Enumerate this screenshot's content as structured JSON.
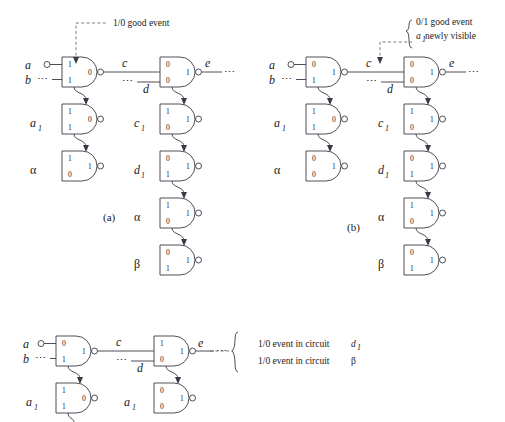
{
  "figure": {
    "panels": [
      {
        "id": "a",
        "caption": "(a)",
        "annotation": {
          "line1": "1/0 good event"
        },
        "inputs": [
          {
            "label": "a",
            "marker": "open-circle"
          },
          {
            "label": "b",
            "marker": "ellipsis"
          }
        ],
        "nets": [
          {
            "label": "c"
          },
          {
            "label": "d"
          },
          {
            "label": "e"
          }
        ],
        "gates": [
          {
            "name": "g-top-left",
            "row_label": "",
            "in_top": "1",
            "in_bottom": "1",
            "out": "0"
          },
          {
            "name": "g-top-right",
            "row_label": "",
            "in_top": "0",
            "in_bottom": "0",
            "out": "1"
          },
          {
            "name": "g-a1",
            "row_label": "a",
            "row_sub": "1",
            "in_top": "1",
            "in_bottom": "1",
            "out": "0"
          },
          {
            "name": "g-alpha-left",
            "row_label": "α",
            "in_top": "1",
            "in_bottom": "0",
            "out": "1"
          },
          {
            "name": "g-c1",
            "row_label": "c",
            "row_sub": "1",
            "in_top": "1",
            "in_bottom": "0",
            "out": "1"
          },
          {
            "name": "g-d1",
            "row_label": "d",
            "row_sub": "1",
            "in_top": "0",
            "in_bottom": "1",
            "out": "1"
          },
          {
            "name": "g-alpha-right",
            "row_label": "α",
            "in_top": "1",
            "in_bottom": "0",
            "out": "1"
          },
          {
            "name": "g-beta-right",
            "row_label": "β",
            "in_top": "0",
            "in_bottom": "1",
            "out": "1"
          }
        ]
      },
      {
        "id": "b",
        "caption": "(b)",
        "annotation": {
          "line1": "0/1 good event",
          "line2_var": "a",
          "line2_sub": "1",
          "line2_rest": " newly visible"
        },
        "inputs": [
          {
            "label": "a",
            "marker": "open-circle"
          },
          {
            "label": "b",
            "marker": "ellipsis"
          }
        ],
        "nets": [
          {
            "label": "c"
          },
          {
            "label": "d"
          },
          {
            "label": "e"
          }
        ],
        "gates": [
          {
            "name": "g-top-left",
            "row_label": "",
            "in_top": "0",
            "in_bottom": "1",
            "out": "1"
          },
          {
            "name": "g-top-right",
            "row_label": "",
            "in_top": "0",
            "in_bottom": "0",
            "out": "1"
          },
          {
            "name": "g-a1",
            "row_label": "a",
            "row_sub": "1",
            "in_top": "1",
            "in_bottom": "1",
            "out": "0"
          },
          {
            "name": "g-alpha-left",
            "row_label": "α",
            "in_top": "0",
            "in_bottom": "0",
            "out": "1"
          },
          {
            "name": "g-c1",
            "row_label": "c",
            "row_sub": "1",
            "in_top": "1",
            "in_bottom": "0",
            "out": "1"
          },
          {
            "name": "g-d1",
            "row_label": "d",
            "row_sub": "1",
            "in_top": "0",
            "in_bottom": "1",
            "out": "1"
          },
          {
            "name": "g-alpha-right",
            "row_label": "α",
            "in_top": "1",
            "in_bottom": "0",
            "out": "1"
          },
          {
            "name": "g-beta-right",
            "row_label": "β",
            "in_top": "0",
            "in_bottom": "1",
            "out": "1"
          }
        ]
      },
      {
        "id": "c",
        "caption": "",
        "annotation": {
          "line1_pre": "1/0 event in circuit ",
          "line1_var": "d",
          "line1_sub": "1",
          "line2_pre": "1/0 event in circuit ",
          "line2_var": "β"
        },
        "inputs": [
          {
            "label": "a",
            "marker": "open-circle"
          },
          {
            "label": "b",
            "marker": "ellipsis"
          }
        ],
        "nets": [
          {
            "label": "c"
          },
          {
            "label": "d"
          },
          {
            "label": "e"
          }
        ],
        "gates": [
          {
            "name": "g-top-left",
            "row_label": "",
            "in_top": "0",
            "in_bottom": "1",
            "out": "1"
          },
          {
            "name": "g-top-right",
            "row_label": "",
            "in_top": "1",
            "in_bottom": "0",
            "out": "1"
          },
          {
            "name": "g-a1-left",
            "row_label": "a",
            "row_sub": "1",
            "in_top": "1",
            "in_bottom": "1",
            "out": "0"
          },
          {
            "name": "g-a1-right",
            "row_label": "a",
            "row_sub": "1",
            "in_top": "0",
            "in_bottom": "0",
            "out": "1"
          }
        ]
      }
    ],
    "glyphs": {
      "ellipsis": "⋯",
      "alpha": "α",
      "beta": "β"
    },
    "colors": {
      "ink": "#3a3a46",
      "text": "#1a1a1a",
      "dashed": "#6b6b78",
      "background": "#ffffff"
    }
  }
}
